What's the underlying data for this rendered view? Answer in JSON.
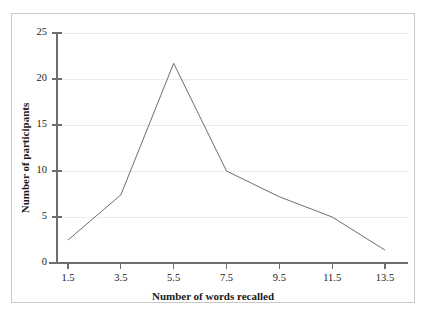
{
  "figure": {
    "background_color": "#ffffff",
    "frame_color": "#c9c9c9",
    "clipped_title_strip": ""
  },
  "chart_data": {
    "type": "line",
    "title": "",
    "xlabel": "Number of words recalled",
    "ylabel": "Number of participants",
    "x": [
      1.5,
      3.5,
      5.5,
      7.5,
      9.5,
      11.5,
      13.5
    ],
    "values": [
      2.5,
      7.4,
      21.7,
      10.0,
      7.2,
      5.0,
      1.4
    ],
    "xticks": [
      "1.5",
      "3.5",
      "5.5",
      "7.5",
      "9.5",
      "11.5",
      "13.5"
    ],
    "yticks": [
      "0",
      "5",
      "10",
      "15",
      "20",
      "25"
    ],
    "xlim": [
      0.5,
      14.5
    ],
    "ylim": [
      0,
      25
    ],
    "grid": "horizontal",
    "gridline_color": "#ececec",
    "line_color": "#6e6e6e",
    "line_width": 1,
    "legend": "none",
    "markers": "none"
  },
  "axes": {
    "y_tick_values": [
      "25",
      "20",
      "15",
      "10",
      "5",
      "0"
    ],
    "x_tick_values": [
      "1.5",
      "3.5",
      "5.5",
      "7.5",
      "9.5",
      "11.5",
      "13.5"
    ],
    "x_title": "Number of words recalled",
    "y_title": "Number of participants",
    "axis_color": "#6e6e6e"
  }
}
